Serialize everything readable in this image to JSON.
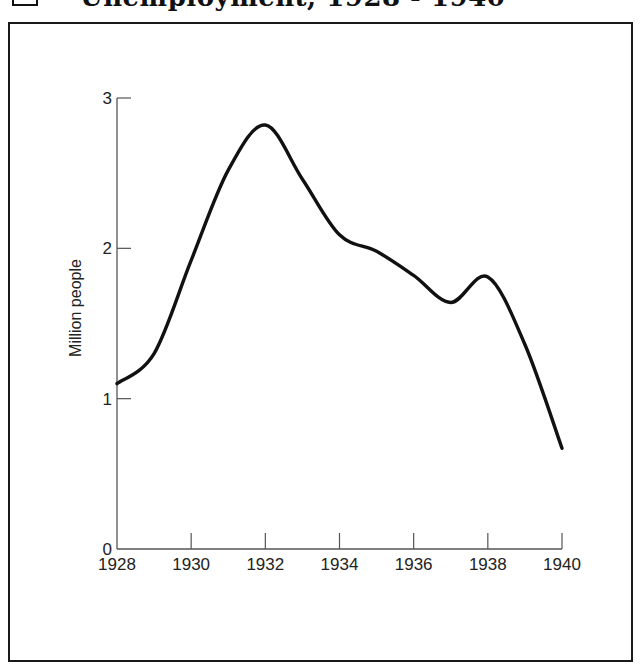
{
  "title": "Unemployment, 1928 - 1940",
  "chart_data": {
    "type": "line",
    "title": "Unemployment, 1928 - 1940",
    "xlabel": "",
    "ylabel": "Million people",
    "xlim": [
      1928,
      1940
    ],
    "ylim": [
      0,
      3
    ],
    "x_ticks": [
      "1928",
      "1930",
      "1932",
      "1934",
      "1936",
      "1938",
      "1940"
    ],
    "y_ticks": [
      "0",
      "1",
      "2",
      "3"
    ],
    "grid": false,
    "legend": null,
    "series": [
      {
        "name": "Unemployment",
        "x": [
          1928,
          1929,
          1930,
          1931,
          1932,
          1933,
          1934,
          1935,
          1936,
          1937,
          1938,
          1939,
          1940
        ],
        "values": [
          1.1,
          1.3,
          1.92,
          2.52,
          2.82,
          2.46,
          2.09,
          1.98,
          1.82,
          1.64,
          1.81,
          1.36,
          0.67
        ]
      }
    ]
  },
  "colors": {
    "line": "#111111",
    "axis": "#555555",
    "frame": "#1a1a1a",
    "background": "#ffffff"
  }
}
